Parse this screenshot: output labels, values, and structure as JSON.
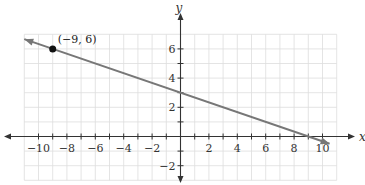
{
  "chart_data": {
    "type": "line",
    "title": "",
    "xlabel": "x",
    "ylabel": "y",
    "xlim": [
      -11,
      11
    ],
    "ylim": [
      -3,
      7
    ],
    "grid": true,
    "x_ticks": [
      -10,
      -8,
      -6,
      -4,
      -2,
      2,
      4,
      6,
      8,
      10
    ],
    "x_tick_labels": [
      "−10",
      "−8",
      "−6",
      "−4",
      "−2",
      "2",
      "4",
      "6",
      "8",
      "10"
    ],
    "y_ticks": [
      6,
      4,
      2,
      -2
    ],
    "y_tick_labels": [
      "6",
      "4",
      "2",
      "−2"
    ],
    "series": [
      {
        "name": "line",
        "equation": "y = -1/3 x + 3",
        "slope": -0.3333,
        "intercept": 3,
        "x": [
          -11,
          10.5
        ],
        "y": [
          6.667,
          -0.5
        ],
        "arrows": "both",
        "color": "#777777"
      }
    ],
    "points": [
      {
        "x": -9,
        "y": 6,
        "label": "(−9, 6)",
        "color": "#111111"
      }
    ]
  },
  "colors": {
    "grid": "#dddddd",
    "axis": "#333333",
    "line": "#777777",
    "point": "#111111"
  }
}
